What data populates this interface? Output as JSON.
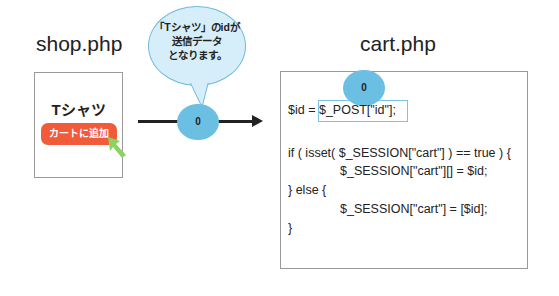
{
  "shop": {
    "title": "shop.php",
    "product_name": "Tシャツ",
    "add_button_label": "カートに追加"
  },
  "bubble": {
    "lines": [
      "「Tシャツ」のidが",
      "送信データ",
      "となります。"
    ]
  },
  "flow_token": "0",
  "cart": {
    "title": "cart.php",
    "token": "0",
    "code": {
      "line1_prefix": "$id = ",
      "line1_highlight": "$_POST[\"id\"];",
      "line2": "if ( isset( $_SESSION[\"cart\"] ) == true ) {",
      "line3": "$_SESSION[\"cart\"][] = $id;",
      "line4": "} else {",
      "line5": "$_SESSION[\"cart\"] = [$id];",
      "line6": "}"
    }
  },
  "colors": {
    "button": "#f25b3a",
    "token": "#6bbfe3",
    "bubble_fill": "#d6eef9",
    "bubble_border": "#6fb9dc",
    "cursor": "#8dd35f"
  }
}
